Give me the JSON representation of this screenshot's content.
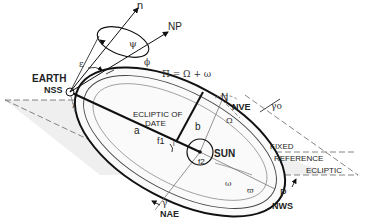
{
  "diagram": {
    "labels": {
      "n": "n",
      "np": "NP",
      "psi": "ψ",
      "epsilon": "ε",
      "phi": "ϕ",
      "earth": "EARTH",
      "nss": "NSS",
      "pi_formula": "Π = Ω + ω",
      "node": "N",
      "nve": "NVE",
      "gamma0": "γo",
      "ecliptic_of_date_1": "ECLIPTIC OF",
      "ecliptic_of_date_2": "DATE",
      "a": "a",
      "b": "b",
      "f1": "f1",
      "i": "i",
      "omega_cap": "Ω",
      "sun": "SUN",
      "f2": "f2",
      "fixed_ref_1": "FIXED",
      "fixed_ref_2": "REFERENCE",
      "fixed_ref_3": "ECLIPTIC",
      "omega_small": "ω",
      "varpi": "ϖ",
      "perihelion": "P",
      "nws": "NWS",
      "gamma": "γ",
      "nae": "NAE",
      "lambda": "λ"
    },
    "colors": {
      "line": "#111111",
      "thin_line": "#777777",
      "plane_fill": "#ececec",
      "background": "#ffffff"
    }
  }
}
